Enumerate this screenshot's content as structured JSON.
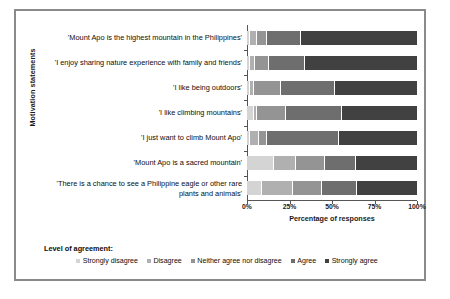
{
  "chart_data": {
    "type": "bar",
    "subtype": "stacked-horizontal-100-percent",
    "title": "",
    "xlabel": "Percentage of responses",
    "ylabel": "Motivation statements",
    "xlim": [
      0,
      100
    ],
    "xticks": [
      0,
      25,
      50,
      75,
      100
    ],
    "xtick_labels": [
      "0%",
      "25%",
      "50%",
      "75%",
      "100%"
    ],
    "grid": false,
    "legend_title": "Level of agreement:",
    "legend_position": "bottom",
    "categories": [
      "'Mount Apo is the highest mountain in the Philippines'",
      "'I enjoy sharing nature experience with family and friends'",
      "'I like being outdoors'",
      "'I like climbing mountains'",
      "'I just want to climb Mount Apo'",
      "'Mount Apo is a sacred mountain'",
      "'There is a chance to see a Philippine eagle or other rare plants and animals'"
    ],
    "series": [
      {
        "name": "Strongly disagree",
        "color": "#d4d4d4",
        "values": [
          2,
          2,
          2,
          4,
          2,
          16,
          9
        ]
      },
      {
        "name": "Disagree",
        "color": "#b0b0b0",
        "values": [
          4,
          3,
          2,
          2,
          5,
          13,
          18
        ]
      },
      {
        "name": "Neither agree nor disagree",
        "color": "#949494",
        "values": [
          6,
          8,
          16,
          17,
          5,
          17,
          17
        ]
      },
      {
        "name": "Agree",
        "color": "#6e6e6e",
        "values": [
          20,
          21,
          32,
          33,
          42,
          18,
          21
        ]
      },
      {
        "name": "Strongly agree",
        "color": "#414141",
        "values": [
          68,
          66,
          48,
          44,
          46,
          36,
          35
        ]
      }
    ]
  },
  "legend": {
    "title": "Level of agreement:",
    "items": [
      {
        "label": "Strongly disagree",
        "color": "#d4d4d4"
      },
      {
        "label": "Disagree",
        "color": "#b0b0b0"
      },
      {
        "label": "Neither agree nor disagree",
        "color": "#949494"
      },
      {
        "label": "Agree",
        "color": "#6e6e6e"
      },
      {
        "label": "Strongly agree",
        "color": "#414141"
      }
    ]
  },
  "axes": {
    "x_title": "Percentage of responses",
    "y_title": "Motivation statements"
  }
}
